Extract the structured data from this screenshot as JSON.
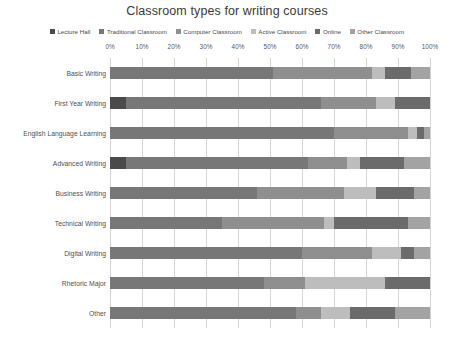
{
  "chart": {
    "title": "Classroom types for writing courses"
  },
  "legend": {
    "position": "top",
    "items": [
      {
        "label": "Lecture Hall",
        "color": "#4a4a4a"
      },
      {
        "label": "Traditional Classroom",
        "color": "#777777"
      },
      {
        "label": "Computer Classroom",
        "color": "#8f8f8f"
      },
      {
        "label": "Active Classroom",
        "color": "#bdbdbd"
      },
      {
        "label": "Online",
        "color": "#6b6b6b"
      },
      {
        "label": "Other Classroom",
        "color": "#a3a3a3"
      }
    ]
  },
  "axis": {
    "ticks": [
      "0%",
      "10%",
      "20%",
      "30%",
      "40%",
      "50%",
      "60%",
      "70%",
      "80%",
      "90%",
      "100%"
    ],
    "xlabel": "",
    "ylabel": "",
    "xlim": [
      0,
      100
    ],
    "grid": true
  },
  "chart_data": {
    "type": "bar",
    "orientation": "horizontal",
    "stacked": true,
    "stack_total": 100,
    "title": "Classroom types for writing courses",
    "xlabel": "",
    "ylabel": "",
    "xlim": [
      0,
      100
    ],
    "grid": true,
    "legend_position": "top",
    "categories": [
      "Basic Writing",
      "First Year Writing",
      "English Language Learning",
      "Advanced Writing",
      "Business Writing",
      "Technical Writing",
      "Digital Writing",
      "Rhetoric Major",
      "Other"
    ],
    "series": [
      {
        "name": "Lecture Hall",
        "color": "#4a4a4a",
        "values": [
          0,
          5,
          0,
          5,
          0,
          0,
          0,
          0,
          0
        ]
      },
      {
        "name": "Traditional Classroom",
        "color": "#777777",
        "values": [
          51,
          61,
          70,
          57,
          46,
          35,
          60,
          48,
          58
        ]
      },
      {
        "name": "Computer Classroom",
        "color": "#8f8f8f",
        "values": [
          31,
          17,
          23,
          12,
          27,
          32,
          22,
          13,
          8
        ]
      },
      {
        "name": "Active Classroom",
        "color": "#bdbdbd",
        "values": [
          4,
          6,
          3,
          4,
          10,
          3,
          9,
          25,
          9
        ]
      },
      {
        "name": "Online",
        "color": "#6b6b6b",
        "values": [
          8,
          11,
          2,
          14,
          12,
          23,
          4,
          14,
          14
        ]
      },
      {
        "name": "Other Classroom",
        "color": "#a3a3a3",
        "values": [
          6,
          0,
          2,
          8,
          5,
          7,
          5,
          0,
          11
        ]
      }
    ]
  }
}
